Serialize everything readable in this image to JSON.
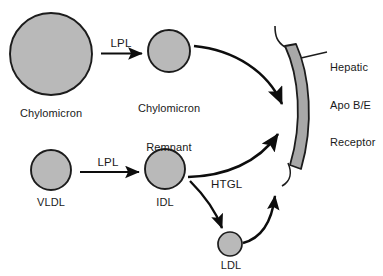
{
  "diagram": {
    "colors": {
      "particle_fill": "#b9b9b9",
      "particle_stroke": "#1c1c1c",
      "receptor_fill": "#a8a8a8",
      "receptor_stroke": "#1c1c1c",
      "arrow": "#0d0d0d",
      "text": "#1a1a1a",
      "background": "#ffffff"
    },
    "particles": [
      {
        "id": "chylomicron",
        "label": "Chylomicron",
        "cx": 51,
        "cy": 54,
        "r": 41
      },
      {
        "id": "chylomicron-remnant",
        "label": "Chylomicron\nRemnant",
        "label_line1": "Chylomicron",
        "label_line2": "Remnant",
        "cx": 169,
        "cy": 51,
        "r": 21
      },
      {
        "id": "vldl",
        "label": "VLDL",
        "cx": 51,
        "cy": 170,
        "r": 20
      },
      {
        "id": "idl",
        "label": "IDL",
        "cx": 165,
        "cy": 169,
        "r": 20
      },
      {
        "id": "ldl",
        "label": "LDL",
        "cx": 230,
        "cy": 244,
        "r": 12
      }
    ],
    "enzymes": [
      {
        "id": "lpl-top",
        "label": "LPL"
      },
      {
        "id": "lpl-bottom",
        "label": "LPL"
      },
      {
        "id": "htgl",
        "label": "HTGL"
      }
    ],
    "receptor": {
      "id": "hepatic-apo-be-receptor",
      "label_line1": "Hepatic",
      "label_line2": "Apo B/E",
      "label_line3": "Receptor"
    }
  }
}
